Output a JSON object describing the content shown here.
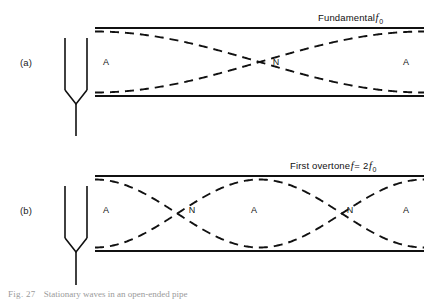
{
  "figure": {
    "caption_prefix": "Fig. 27",
    "caption_text": "Stationary waves in an open-ended pipe",
    "background_color": "#ffffff",
    "line_color": "#111111"
  },
  "panels": [
    {
      "tag": "(a)",
      "tag_x": 20,
      "tag_y": 57,
      "mode": {
        "prefix": "Fundamental",
        "symbol": "f",
        "subscript": "0",
        "suffix": "",
        "x": 318,
        "y": 12
      },
      "pipe": {
        "x0": 95,
        "x1": 424,
        "top_y": 28,
        "bottom_y": 96
      },
      "fork": {
        "cx": 76,
        "prong_top": 38,
        "prong_gap": 11,
        "bend_y": 104,
        "stem_bottom": 136
      },
      "harmonic": 1,
      "labels": [
        {
          "text": "A",
          "x": 106,
          "y": 57,
          "type": "antinode"
        },
        {
          "text": "N",
          "x": 276,
          "y": 57,
          "type": "node"
        },
        {
          "text": "A",
          "x": 406,
          "y": 57,
          "type": "antinode"
        }
      ]
    },
    {
      "tag": "(b)",
      "tag_x": 20,
      "tag_y": 205,
      "mode": {
        "prefix": "First overtone",
        "symbol": "f",
        "equals": "=",
        "multiplier": "2",
        "symbol2": "f",
        "subscript": "0",
        "x": 290,
        "y": 160
      },
      "pipe": {
        "x0": 95,
        "x1": 424,
        "top_y": 176,
        "bottom_y": 251
      },
      "fork": {
        "cx": 76,
        "prong_top": 186,
        "prong_gap": 11,
        "bend_y": 252,
        "stem_bottom": 285
      },
      "harmonic": 2,
      "labels": [
        {
          "text": "A",
          "x": 106,
          "y": 205,
          "type": "antinode"
        },
        {
          "text": "N",
          "x": 192,
          "y": 205,
          "type": "node"
        },
        {
          "text": "A",
          "x": 254,
          "y": 205,
          "type": "antinode"
        },
        {
          "text": "N",
          "x": 350,
          "y": 205,
          "type": "node"
        },
        {
          "text": "A",
          "x": 406,
          "y": 205,
          "type": "antinode"
        }
      ]
    }
  ],
  "chart_data": {
    "type": "line",
    "title": "Stationary waves in an open-ended pipe",
    "series": [
      {
        "name": "Fundamental f0 upper envelope",
        "panel": "(a)",
        "harmonic": 1,
        "antinode_positions": [
          95,
          424
        ],
        "node_positions": [
          259.5
        ],
        "shape": "cosine envelope, half wavelength across pipe"
      },
      {
        "name": "Fundamental f0 lower envelope",
        "panel": "(a)",
        "harmonic": 1,
        "shape": "mirror of upper envelope"
      },
      {
        "name": "First overtone f = 2f0 upper envelope",
        "panel": "(b)",
        "harmonic": 2,
        "antinode_positions": [
          95,
          259.5,
          424
        ],
        "node_positions": [
          177.25,
          341.75
        ],
        "shape": "cosine envelope, full wavelength across pipe"
      },
      {
        "name": "First overtone f = 2f0 lower envelope",
        "panel": "(b)",
        "harmonic": 2,
        "shape": "mirror of upper envelope"
      }
    ],
    "xlabel": "position along pipe",
    "ylabel": "displacement amplitude",
    "grid": false,
    "legend": false
  }
}
